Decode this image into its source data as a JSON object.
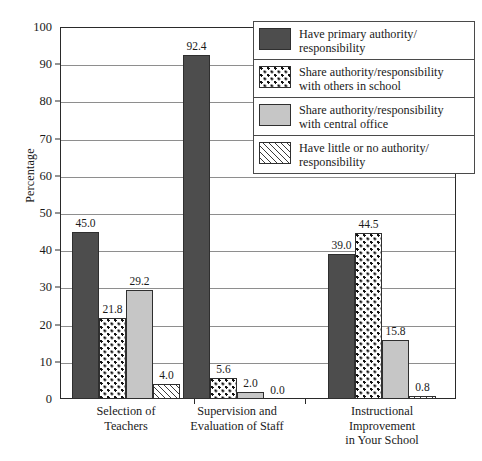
{
  "chart_data": {
    "type": "bar",
    "title": "",
    "xlabel": "",
    "ylabel": "Percentage",
    "ylim": [
      0,
      100
    ],
    "ytick_step": 10,
    "yticks": [
      0,
      10,
      20,
      30,
      40,
      50,
      60,
      70,
      80,
      90,
      100
    ],
    "grid": true,
    "legend_position": "top-right-inside",
    "categories": [
      "Selection of\nTeachers",
      "Supervision and\nEvaluation of Staff",
      "Instructional\nImprovement\nin Your School"
    ],
    "series": [
      {
        "name": "Have primary authority/\nresponsibility",
        "pattern": "solid-dark",
        "color": "#4d4d4d",
        "values": [
          45.0,
          92.4,
          39.0
        ],
        "labels": [
          "45.0",
          "92.4",
          "39.0"
        ]
      },
      {
        "name": "Share authority/responsibility\nwith others in school",
        "pattern": "dots",
        "color": "#ffffff",
        "values": [
          21.8,
          5.6,
          44.5
        ],
        "labels": [
          "21.8",
          "5.6",
          "44.5"
        ]
      },
      {
        "name": "Share authority/responsibility\nwith central office",
        "pattern": "solid-light",
        "color": "#c6c6c6",
        "values": [
          29.2,
          2.0,
          15.8
        ],
        "labels": [
          "29.2",
          "2.0",
          "15.8"
        ]
      },
      {
        "name": "Have little or no authority/\nresponsibility",
        "pattern": "hatch",
        "color": "#ffffff",
        "values": [
          4.0,
          0.0,
          0.8
        ],
        "labels": [
          "4.0",
          "0.0",
          "0.8"
        ]
      }
    ]
  }
}
